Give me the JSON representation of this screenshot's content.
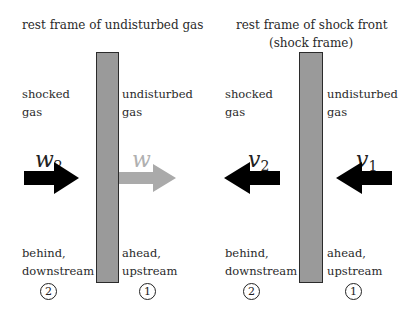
{
  "left_panel": {
    "title": "rest frame of undisturbed gas",
    "left_label": [
      "shocked",
      "gas"
    ],
    "right_label": [
      "undisturbed",
      "gas"
    ],
    "arrow_left": {
      "symbol": "w",
      "subscript": "2",
      "direction": "right",
      "color": "#000000"
    },
    "arrow_right": {
      "symbol": "w",
      "subscript": "",
      "direction": "right",
      "color": "#aaaaaa"
    },
    "bottom_left": [
      "behind,",
      "downstream"
    ],
    "bottom_right": [
      "ahead,",
      "upstream"
    ],
    "region_left": "2",
    "region_right": "1"
  },
  "right_panel": {
    "title": [
      "rest frame of shock front",
      "(shock frame)"
    ],
    "left_label": [
      "shocked",
      "gas"
    ],
    "right_label": [
      "undisturbed",
      "gas"
    ],
    "arrow_left": {
      "symbol": "v",
      "subscript": "2",
      "direction": "left",
      "color": "#000000"
    },
    "arrow_right": {
      "symbol": "v",
      "subscript": "1",
      "direction": "left",
      "color": "#000000"
    },
    "bottom_left": [
      "behind,",
      "downstream"
    ],
    "bottom_right": [
      "ahead,",
      "upstream"
    ],
    "region_left": "2",
    "region_right": "1"
  },
  "colors": {
    "shock_fill": "#9a9a9a",
    "shock_border": "#2b2b2b",
    "faded_arrow": "#aaaaaa"
  }
}
